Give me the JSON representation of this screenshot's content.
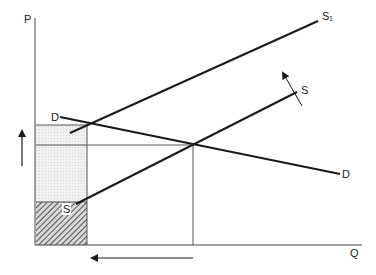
{
  "diagram": {
    "type": "supply-demand",
    "axes": {
      "y_label": "P",
      "x_label": "Q"
    },
    "curves": {
      "supply_original": {
        "label": "S",
        "start_label": "S"
      },
      "supply_shifted": {
        "label": "S₁"
      },
      "demand": {
        "label_left": "D",
        "label_right": "D"
      }
    },
    "annotations": {
      "price_arrow": "up-arrow",
      "quantity_arrow": "left-arrow",
      "shift_arrow": "supply-shift-arrow"
    },
    "regions": {
      "light_shaded": "price-increase area",
      "hatched": "area below original supply price"
    },
    "colors": {
      "line": "#1a1a1a",
      "shade": "#e8e8e8",
      "hatch": "#555555"
    }
  }
}
